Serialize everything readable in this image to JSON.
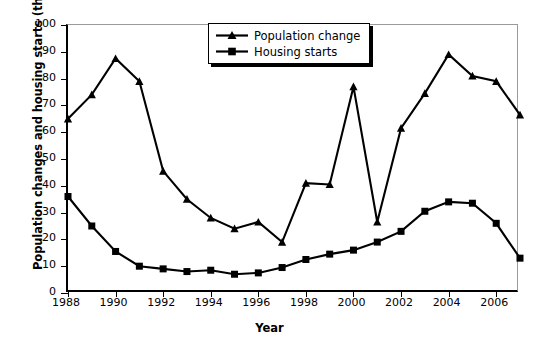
{
  "chart_data": {
    "type": "line",
    "title": "",
    "xlabel": "Year",
    "ylabel": "Population changes and housing starts (thousands)",
    "xlim": [
      1988,
      2007
    ],
    "ylim": [
      0,
      100
    ],
    "grid": false,
    "legend_position": "top-center",
    "x": [
      1988,
      1989,
      1990,
      1991,
      1992,
      1993,
      1994,
      1995,
      1996,
      1997,
      1998,
      1999,
      2000,
      2001,
      2002,
      2003,
      2004,
      2005,
      2006,
      2007
    ],
    "xticks": [
      "1988",
      "1990",
      "1992",
      "1994",
      "1996",
      "1998",
      "2000",
      "2002",
      "2004",
      "2006"
    ],
    "xtick_values": [
      1988,
      1990,
      1992,
      1994,
      1996,
      1998,
      2000,
      2002,
      2004,
      2006
    ],
    "yticks": [
      "0",
      "10",
      "20",
      "30",
      "40",
      "50",
      "60",
      "70",
      "80",
      "90",
      "100"
    ],
    "ytick_values": [
      0,
      10,
      20,
      30,
      40,
      50,
      60,
      70,
      80,
      90,
      100
    ],
    "series": [
      {
        "name": "Population change",
        "marker": "triangle",
        "color": "#000000",
        "values": [
          65,
          74,
          87.5,
          79,
          45.5,
          35,
          28,
          24,
          26.5,
          19,
          41,
          40.5,
          77,
          26.5,
          61.5,
          74.5,
          89,
          81,
          79,
          66.5
        ]
      },
      {
        "name": "Housing starts",
        "marker": "square",
        "color": "#000000",
        "values": [
          36,
          25,
          15.5,
          10,
          9,
          8,
          8.5,
          7,
          7.5,
          9.5,
          12.5,
          14.5,
          16,
          19,
          23,
          30.5,
          34,
          33.5,
          26,
          13
        ]
      }
    ]
  },
  "legend": {
    "items": [
      {
        "label": "Population change",
        "marker": "triangle"
      },
      {
        "label": "Housing starts",
        "marker": "square"
      }
    ]
  }
}
